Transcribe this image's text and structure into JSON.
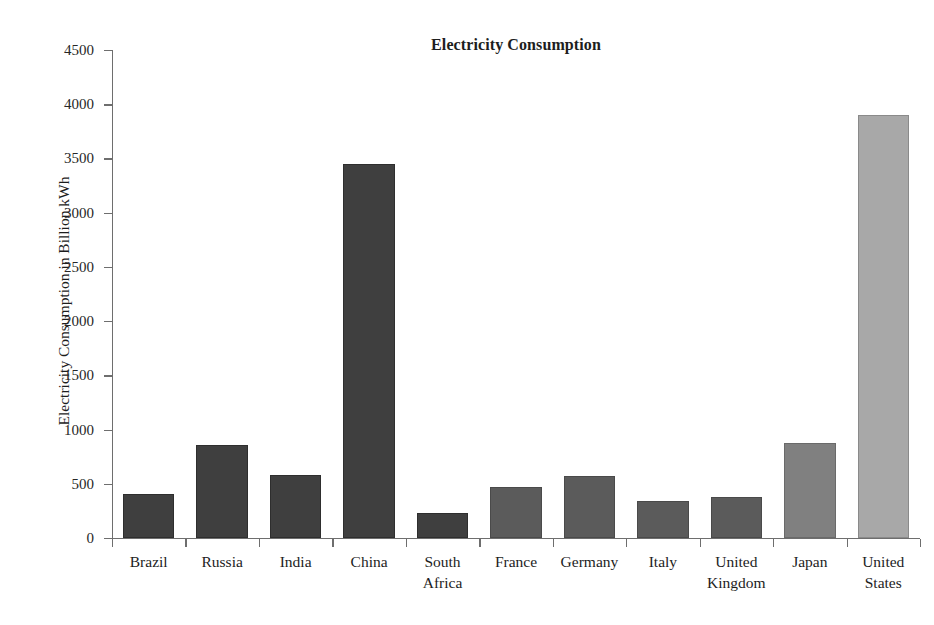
{
  "chart_data": {
    "type": "bar",
    "title": "Electricity Consumption",
    "xlabel": "",
    "ylabel": "Electricity Consumption in Billion kWh",
    "categories": [
      "Brazil",
      "Russia",
      "India",
      "China",
      "South Africa",
      "France",
      "Germany",
      "Italy",
      "United Kingdom",
      "Japan",
      "United States"
    ],
    "category_lines": [
      [
        "Brazil"
      ],
      [
        "Russia"
      ],
      [
        "India"
      ],
      [
        "China"
      ],
      [
        "South",
        "Africa"
      ],
      [
        "France"
      ],
      [
        "Germany"
      ],
      [
        "Italy"
      ],
      [
        "United",
        "Kingdom"
      ],
      [
        "Japan"
      ],
      [
        "United",
        "States"
      ]
    ],
    "values": [
      410,
      860,
      580,
      3450,
      230,
      470,
      570,
      345,
      375,
      880,
      3900
    ],
    "bar_colors": [
      "#3f3f3f",
      "#3f3f3f",
      "#3f3f3f",
      "#3f3f3f",
      "#3f3f3f",
      "#5b5b5b",
      "#5b5b5b",
      "#5b5b5b",
      "#5b5b5b",
      "#808080",
      "#a8a8a8"
    ],
    "bar_edge_colors": [
      "#2e2e2e",
      "#2e2e2e",
      "#2e2e2e",
      "#2e2e2e",
      "#2e2e2e",
      "#4a4a4a",
      "#4a4a4a",
      "#4a4a4a",
      "#4a4a4a",
      "#6a6a6a",
      "#8a8a8a"
    ],
    "ylim": [
      0,
      4500
    ],
    "yticks": [
      0,
      500,
      1000,
      1500,
      2000,
      2500,
      3000,
      3500,
      4000,
      4500
    ],
    "ytick_labels": [
      "0",
      "500",
      "1000",
      "1500",
      "2000",
      "2500",
      "3000",
      "3500",
      "4000",
      "4500"
    ],
    "grid": false,
    "legend": false,
    "axis_color": "#6e6e6e",
    "background_color": "#ffffff"
  }
}
